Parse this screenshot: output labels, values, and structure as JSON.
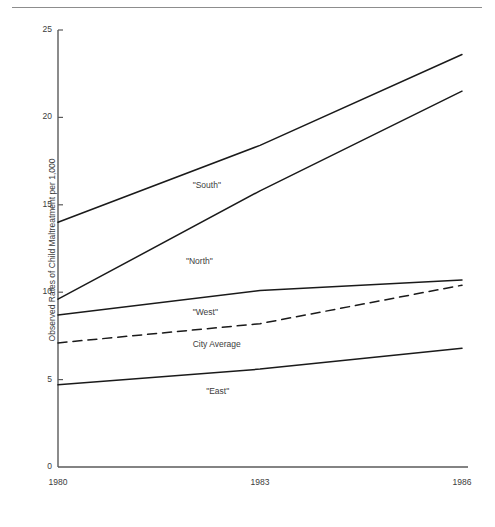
{
  "page": {
    "header_ghost_text": "",
    "background": "#ffffff",
    "line_color": "#1a1a1a",
    "axis_color": "#5a5a5a",
    "text_color": "#3c3c3c"
  },
  "chart_data": {
    "type": "line",
    "title": "",
    "xlabel": "",
    "ylabel": "Observed Rates of Child Maltreatment per 1,000",
    "x": [
      1980,
      1983,
      1986
    ],
    "categories": [
      "1980",
      "1983",
      "1986"
    ],
    "xtick_labels": [
      "1980",
      "1983",
      "1986"
    ],
    "ytick_labels": [
      "0",
      "5",
      "10",
      "15",
      "20",
      "25"
    ],
    "yticks": [
      0,
      5,
      10,
      15,
      20,
      25
    ],
    "ylim": [
      0,
      25
    ],
    "xlim": [
      1980,
      1986
    ],
    "grid": false,
    "legend": "inline-annotations",
    "series": [
      {
        "name": "\"South\"",
        "label": "\"South\"",
        "style": "solid",
        "values": [
          14.0,
          18.4,
          23.6
        ],
        "label_x": 1982.0,
        "label_y": 16.1
      },
      {
        "name": "\"North\"",
        "label": "\"North\"",
        "style": "solid",
        "values": [
          9.6,
          15.8,
          21.5
        ],
        "label_x": 1981.9,
        "label_y": 11.7
      },
      {
        "name": "\"West\"",
        "label": "\"West\"",
        "style": "solid",
        "values": [
          8.7,
          10.1,
          10.7
        ],
        "label_x": 1982.0,
        "label_y": 8.8
      },
      {
        "name": "City Average",
        "label": "City Average",
        "style": "dashed",
        "values": [
          7.1,
          8.2,
          10.4
        ],
        "label_x": 1982.0,
        "label_y": 7.0
      },
      {
        "name": "\"East\"",
        "label": "\"East\"",
        "style": "solid",
        "values": [
          4.7,
          5.6,
          6.8
        ],
        "label_x": 1982.2,
        "label_y": 4.3
      }
    ]
  }
}
